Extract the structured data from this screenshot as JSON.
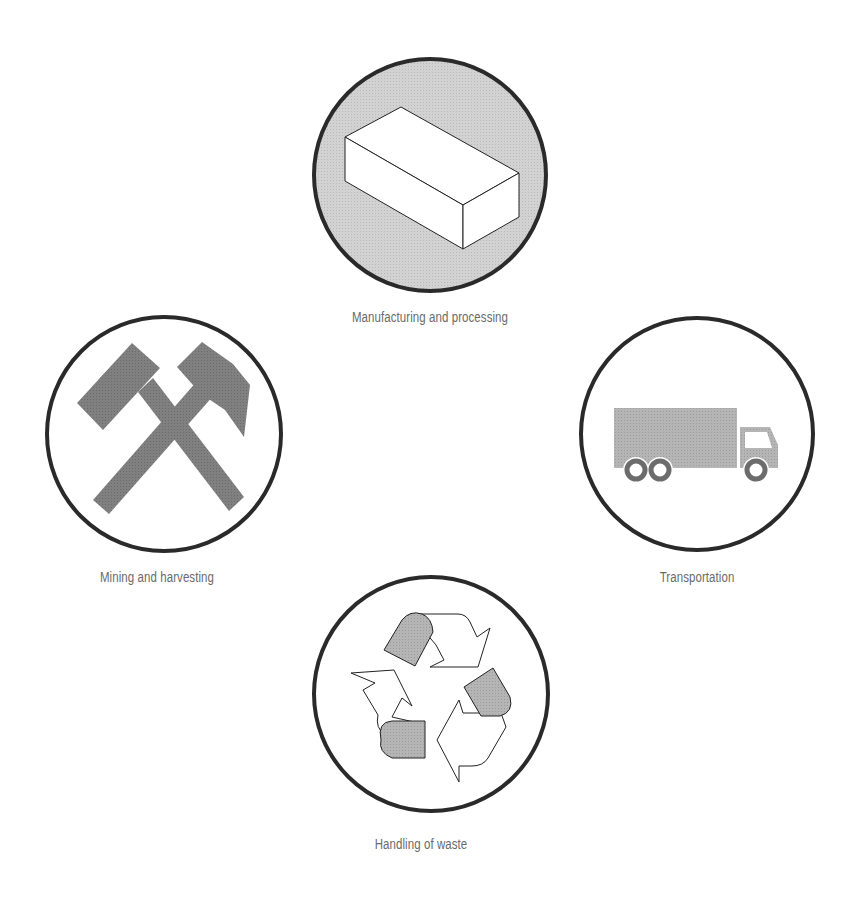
{
  "diagram": {
    "type": "cycle",
    "nodes": [
      {
        "id": "manufacturing",
        "label": "Manufacturing and processing",
        "icon": "brick-icon",
        "position": "top",
        "filled": true
      },
      {
        "id": "transportation",
        "label": "Transportation",
        "icon": "truck-icon",
        "position": "right",
        "filled": false
      },
      {
        "id": "waste",
        "label": "Handling of waste",
        "icon": "recycle-icon",
        "position": "bottom",
        "filled": false
      },
      {
        "id": "mining",
        "label": "Mining and harvesting",
        "icon": "crossed-hammers-icon",
        "position": "left",
        "filled": false
      }
    ],
    "colors": {
      "circle_stroke": "#2a2a2a",
      "highlight_fill": "#cfcfcf",
      "icon_fill": "#7d7d7d",
      "truck_fill": "#b3b3b3",
      "label_text": "#6a6a6a"
    }
  }
}
